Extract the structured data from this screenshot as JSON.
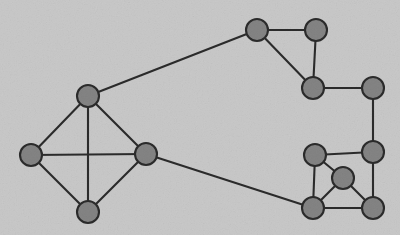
{
  "figure": {
    "kind": "node-link-graph-diagram",
    "background_color": "#c9c9c9",
    "node_fill_color": "#848484",
    "node_stroke_color": "#2b2b2b",
    "edge_color": "#2b2b2b",
    "node_radius": 11,
    "node_count": 13,
    "edge_count": 20,
    "width": 400,
    "height": 235
  },
  "chart_data": {
    "type": "graph",
    "title": "",
    "xlabel": "",
    "ylabel": "",
    "grid": false,
    "legend": "none",
    "nodes": [
      {
        "id": "n1",
        "label": "",
        "x": 88,
        "y": 96,
        "cluster": "left"
      },
      {
        "id": "n2",
        "label": "",
        "x": 31,
        "y": 155,
        "cluster": "left"
      },
      {
        "id": "n3",
        "label": "",
        "x": 146,
        "y": 154,
        "cluster": "left"
      },
      {
        "id": "n4",
        "label": "",
        "x": 88,
        "y": 212,
        "cluster": "left"
      },
      {
        "id": "n5",
        "label": "",
        "x": 257,
        "y": 30,
        "cluster": "top-right"
      },
      {
        "id": "n6",
        "label": "",
        "x": 316,
        "y": 30,
        "cluster": "top-right"
      },
      {
        "id": "n7",
        "label": "",
        "x": 313,
        "y": 88,
        "cluster": "top-right"
      },
      {
        "id": "n8",
        "label": "",
        "x": 373,
        "y": 88,
        "cluster": "top-right"
      },
      {
        "id": "n9",
        "label": "",
        "x": 315,
        "y": 155,
        "cluster": "bottom-right"
      },
      {
        "id": "n10",
        "label": "",
        "x": 373,
        "y": 152,
        "cluster": "bottom-right"
      },
      {
        "id": "n11",
        "label": "",
        "x": 343,
        "y": 178,
        "cluster": "bottom-right"
      },
      {
        "id": "n12",
        "label": "",
        "x": 313,
        "y": 208,
        "cluster": "bottom-right"
      },
      {
        "id": "n13",
        "label": "",
        "x": 373,
        "y": 208,
        "cluster": "bottom-right"
      }
    ],
    "edges": [
      {
        "source": "n1",
        "target": "n2"
      },
      {
        "source": "n1",
        "target": "n3"
      },
      {
        "source": "n1",
        "target": "n4"
      },
      {
        "source": "n2",
        "target": "n3"
      },
      {
        "source": "n2",
        "target": "n4"
      },
      {
        "source": "n3",
        "target": "n4"
      },
      {
        "source": "n1",
        "target": "n5"
      },
      {
        "source": "n5",
        "target": "n6"
      },
      {
        "source": "n5",
        "target": "n7"
      },
      {
        "source": "n6",
        "target": "n7"
      },
      {
        "source": "n7",
        "target": "n8"
      },
      {
        "source": "n8",
        "target": "n10"
      },
      {
        "source": "n3",
        "target": "n12"
      },
      {
        "source": "n9",
        "target": "n10"
      },
      {
        "source": "n9",
        "target": "n11"
      },
      {
        "source": "n9",
        "target": "n12"
      },
      {
        "source": "n10",
        "target": "n13"
      },
      {
        "source": "n11",
        "target": "n12"
      },
      {
        "source": "n11",
        "target": "n13"
      },
      {
        "source": "n12",
        "target": "n13"
      }
    ]
  }
}
